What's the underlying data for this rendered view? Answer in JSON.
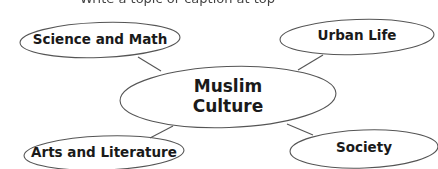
{
  "header": {
    "clipped_text": "Write a topic or caption at top"
  },
  "diagram": {
    "type": "web-organizer",
    "stroke_color": "#555555",
    "center": {
      "label": "Muslim\nCulture"
    },
    "nodes": [
      {
        "id": "science-and-math",
        "label": "Science and Math"
      },
      {
        "id": "urban-life",
        "label": "Urban Life"
      },
      {
        "id": "arts-and-literature",
        "label": "Arts and Literature"
      },
      {
        "id": "society",
        "label": "Society"
      }
    ]
  }
}
